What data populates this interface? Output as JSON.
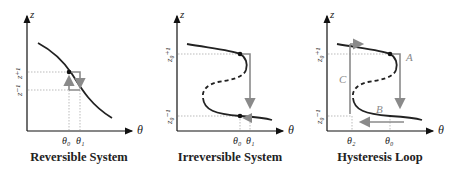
{
  "panels": [
    {
      "caption": "Reversible System",
      "y_axis_label": "z",
      "x_axis_label": "θ",
      "y_tick_labels": [
        "z⁺¹",
        "z⁻¹"
      ],
      "x_tick_labels": [
        "θ₀",
        "θ₁"
      ]
    },
    {
      "caption": "Irreversible System",
      "y_axis_label": "z",
      "x_axis_label": "θ",
      "y_tick_labels": [
        "z₀⁺¹",
        "z₀⁻¹"
      ],
      "x_tick_labels": [
        "θ₀",
        "θ₁"
      ]
    },
    {
      "caption": "Hysteresis Loop",
      "y_axis_label": "z",
      "x_axis_label": "θ",
      "y_tick_labels": [
        "z₀⁺¹",
        "z₀⁻¹"
      ],
      "x_tick_labels": [
        "θ₂",
        "θ₀"
      ],
      "branch_labels": [
        "A",
        "B",
        "C"
      ]
    }
  ],
  "colors": {
    "curve": "#222222",
    "arrow": "#8a8a8a",
    "guide": "#9a9a9a",
    "axis": "#111111"
  }
}
